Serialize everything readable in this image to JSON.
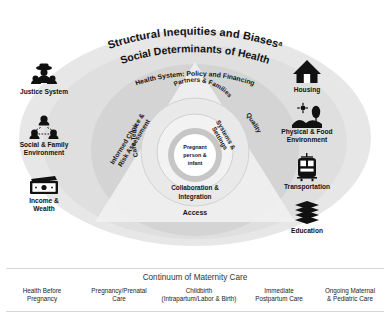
{
  "figure": {
    "outer_title": "Structural Inequities and Biases",
    "outer_title_superscript": "a",
    "second_title": "Social Determinants of Health",
    "third_title": "Health System: Policy and Financing"
  },
  "triangle": {
    "left_label_line1": "Informed Choice &",
    "left_label_line2": "Risk Assessment",
    "right_label": "Quality",
    "bottom_label": "Access"
  },
  "rings": {
    "outer_ring_left": "Care Team",
    "outer_ring_top": "Partners & Families",
    "outer_ring_right_line1": "Systems &",
    "outer_ring_right_line2": "Settings",
    "ring_bottom_line1": "Collaboration &",
    "ring_bottom_line2": "Integration",
    "core_line1": "Pregnant",
    "core_line2": "person &",
    "core_line3": "infant"
  },
  "determinants_left": [
    {
      "icon": "police-officer-icon",
      "label_line1": "Justice System",
      "label_line2": ""
    },
    {
      "icon": "family-network-icon",
      "label_line1": "Social & Family",
      "label_line2": "Environment"
    },
    {
      "icon": "money-banknote-icon",
      "label_line1": "Income &",
      "label_line2": "Wealth"
    }
  ],
  "determinants_right": [
    {
      "icon": "house-icon",
      "label_line1": "Housing",
      "label_line2": ""
    },
    {
      "icon": "landscape-tree-sun-icon",
      "label_line1": "Physical & Food",
      "label_line2": "Environment"
    },
    {
      "icon": "tram-icon",
      "label_line1": "Transportation",
      "label_line2": ""
    },
    {
      "icon": "books-stack-icon",
      "label_line1": "Education",
      "label_line2": ""
    }
  ],
  "continuum": {
    "title": "Continuum of Maternity Care",
    "stages": [
      {
        "line1": "Health Before",
        "line2": "Pregnancy"
      },
      {
        "line1": "Pregnancy/Prenatal",
        "line2": "Care"
      },
      {
        "line1": "Childbirth",
        "line2": "(Intrapartum/Labor & Birth)"
      },
      {
        "line1": "Immediate",
        "line2": "Postpartum Care"
      },
      {
        "line1": "Ongoing Maternal",
        "line2": "& Pediatric Care"
      }
    ]
  },
  "colors": {
    "ellipse_outer": "#e6e6e6",
    "ellipse_mid": "#dcdcdc",
    "ellipse_inner": "#d2d2d2",
    "circle_core_ring": "#c9c9c9",
    "triangle": "#efefef",
    "text": "#161616"
  }
}
